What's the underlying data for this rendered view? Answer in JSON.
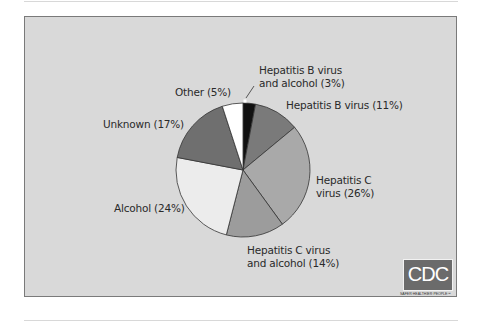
{
  "chart_data": {
    "type": "pie",
    "title": "",
    "categories": [
      "Hepatitis B virus and alcohol",
      "Hepatitis B virus",
      "Hepatitis C virus",
      "Hepatitis C virus and alcohol",
      "Alcohol",
      "Unknown",
      "Other"
    ],
    "values": [
      3,
      11,
      26,
      14,
      24,
      17,
      5
    ],
    "colors": [
      "#111111",
      "#7a7a7a",
      "#a9a9a9",
      "#9c9c9c",
      "#ececec",
      "#6f6f6f",
      "#ffffff"
    ],
    "labels": [
      "Hepatitis B virus and alcohol (3%)",
      "Hepatitis B virus (11%)",
      "Hepatitis C virus (26%)",
      "Hepatitis C virus and alcohol (14%)",
      "Alcohol (24%)",
      "Unknown (17%)",
      "Other (5%)"
    ],
    "start_angle_deg": 0,
    "direction": "clockwise"
  },
  "labels": {
    "hbv_alcohol_line1": "Hepatitis B virus",
    "hbv_alcohol_line2": "and alcohol (3%)",
    "hbv": "Hepatitis B virus (11%)",
    "hcv_line1": "Hepatitis C",
    "hcv_line2": "virus (26%)",
    "hcv_alcohol_line1": "Hepatitis C virus",
    "hcv_alcohol_line2": "and alcohol (14%)",
    "alcohol": "Alcohol (24%)",
    "unknown": "Unknown (17%)",
    "other": "Other (5%)"
  },
  "logo": {
    "text": "CDC",
    "tagline": "SAFER·HEALTHIER·PEOPLE™"
  }
}
